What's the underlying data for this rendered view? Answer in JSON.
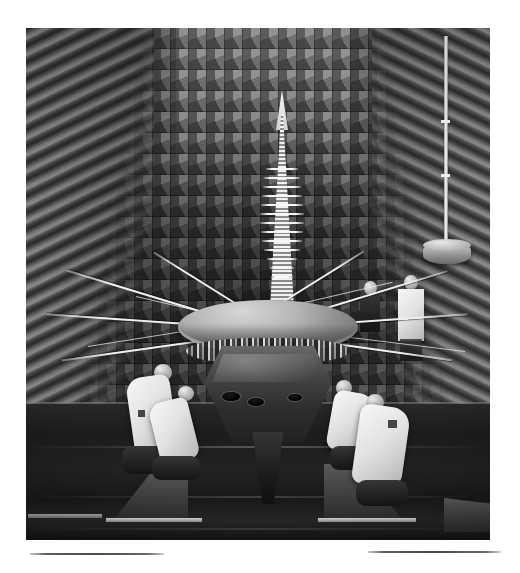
{
  "page": {
    "background_color": "#ffffff",
    "width": 520,
    "height": 573
  },
  "photograph": {
    "name": "spacecraft-anechoic-chamber-photo",
    "kind": "black-and-white photograph",
    "alt_text": "A spinning-disc spacecraft with a large dish antenna and a tall conical antenna mast stands on support stands in an anechoic test chamber; four technicians in white coveralls work around its base while two more stand behind it.",
    "frame": {
      "left": 26,
      "top": 28,
      "width": 464,
      "height": 512
    },
    "tone": "grayscale",
    "scene_elements": {
      "chamber_back_wall": "grid-of-pyramidal-rf-absorbers",
      "chamber_left_wall": "receding-pyramidal-rf-absorbers",
      "chamber_right_wall": "receding-pyramidal-rf-absorbers",
      "chamber_floor": "dark-matte-floor"
    }
  },
  "spacecraft": {
    "name": "spacecraft-model",
    "high_gain_dish": "parabolic-dish-antenna",
    "antenna_mast": "conical-log-periodic-antenna-mast",
    "bus": "hexagonal-equipment-bus",
    "booms": "instrument-and-rtg-booms",
    "lower_adapter": "launch-vehicle-adapter-cone"
  },
  "equipment": {
    "probe_pole_label": "vertical-probe-antenna-mast",
    "probe_base_label": "probe-antenna-base-drum",
    "support_stands": [
      "left-support-stand",
      "right-support-stand",
      "far-right-support-stand"
    ]
  },
  "people": [
    {
      "id": "technician-front-left",
      "label": "technician in white coveralls, kneeling at left of spacecraft"
    },
    {
      "id": "technician-mid-left",
      "label": "technician in white coveralls, crouched at left front"
    },
    {
      "id": "technician-mid-right",
      "label": "technician in white coveralls, crouched at right front"
    },
    {
      "id": "technician-front-right",
      "label": "technician in white coveralls, kneeling at right of spacecraft"
    },
    {
      "id": "technician-back-left",
      "label": "technician standing behind the spacecraft, left"
    },
    {
      "id": "technician-back-right",
      "label": "technician standing behind the spacecraft, right"
    }
  ],
  "rules": [
    {
      "id": "caption-rule-left",
      "left": 30,
      "top": 553,
      "width": 134
    },
    {
      "id": "caption-rule-right",
      "left": 368,
      "top": 551,
      "width": 133
    }
  ],
  "colors": {
    "page_background": "#ffffff",
    "photo_midtone": "#6e6e6e",
    "photo_shadow": "#1a1a1a",
    "photo_highlight": "#f4f3ef",
    "rule_color": "#4a4a4a"
  },
  "text": {
    "visible_text": ""
  }
}
